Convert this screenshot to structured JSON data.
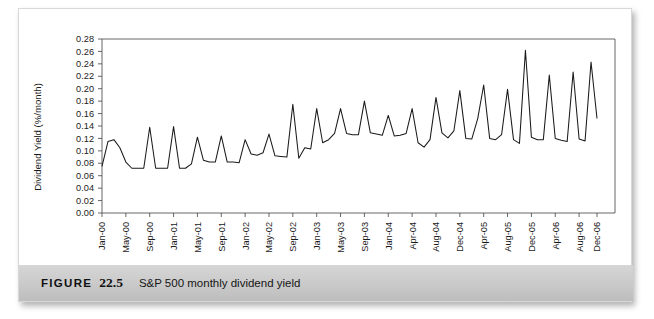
{
  "figure": {
    "label": "FIGURE",
    "number": "22.5",
    "caption": "S&P 500 monthly dividend yield"
  },
  "chart_data": {
    "type": "line",
    "title": "",
    "xlabel": "",
    "ylabel": "Dividend Yield (%/month)",
    "ylim": [
      0.0,
      0.28
    ],
    "ytick_step": 0.02,
    "ytick_labels": [
      "0.00",
      "0.02",
      "0.04",
      "0.06",
      "0.08",
      "0.10",
      "0.12",
      "0.14",
      "0.16",
      "0.18",
      "0.20",
      "0.22",
      "0.24",
      "0.26",
      "0.28"
    ],
    "grid": false,
    "legend": "none",
    "line_color": "#1a1a1a",
    "axis_color": "#555555",
    "xtick_labels": [
      "Jan-00",
      "May-00",
      "Sep-00",
      "Jan-01",
      "May-01",
      "Sep-01",
      "Jan-02",
      "May-02",
      "Sep-02",
      "Jan-03",
      "May-03",
      "Sep-03",
      "Jan-04",
      "Apr-04",
      "Aug-04",
      "Dec-04",
      "Apr-05",
      "Aug-05",
      "Dec-05",
      "Apr-06",
      "Aug-06",
      "Dec-06"
    ],
    "x_start": "Jan-00",
    "x_end": "Dec-06",
    "x_labels_every_n_points": 4,
    "x": [
      "Jan-00",
      "Feb-00",
      "Mar-00",
      "Apr-00",
      "May-00",
      "Jun-00",
      "Jul-00",
      "Aug-00",
      "Sep-00",
      "Oct-00",
      "Nov-00",
      "Dec-00",
      "Jan-01",
      "Feb-01",
      "Mar-01",
      "Apr-01",
      "May-01",
      "Jun-01",
      "Jul-01",
      "Aug-01",
      "Sep-01",
      "Oct-01",
      "Nov-01",
      "Dec-01",
      "Jan-02",
      "Feb-02",
      "Mar-02",
      "Apr-02",
      "May-02",
      "Jun-02",
      "Jul-02",
      "Aug-02",
      "Sep-02",
      "Oct-02",
      "Nov-02",
      "Dec-02",
      "Jan-03",
      "Feb-03",
      "Mar-03",
      "Apr-03",
      "May-03",
      "Jun-03",
      "Jul-03",
      "Aug-03",
      "Sep-03",
      "Oct-03",
      "Nov-03",
      "Dec-03",
      "Jan-04",
      "Feb-04",
      "Mar-04",
      "Apr-04",
      "May-04",
      "Jun-04",
      "Jul-04",
      "Aug-04",
      "Sep-04",
      "Oct-04",
      "Nov-04",
      "Dec-04",
      "Jan-05",
      "Feb-05",
      "Mar-05",
      "Apr-05",
      "May-05",
      "Jun-05",
      "Jul-05",
      "Aug-05",
      "Sep-05",
      "Oct-05",
      "Nov-05",
      "Dec-05",
      "Jan-06",
      "Feb-06",
      "Mar-06",
      "Apr-06",
      "May-06",
      "Jun-06",
      "Jul-06",
      "Aug-06",
      "Sep-06",
      "Oct-06",
      "Nov-06",
      "Dec-06"
    ],
    "values": [
      0.075,
      0.115,
      0.118,
      0.105,
      0.082,
      0.072,
      0.072,
      0.072,
      0.138,
      0.072,
      0.072,
      0.072,
      0.139,
      0.072,
      0.072,
      0.079,
      0.122,
      0.085,
      0.082,
      0.082,
      0.124,
      0.082,
      0.082,
      0.081,
      0.118,
      0.095,
      0.093,
      0.097,
      0.127,
      0.092,
      0.091,
      0.09,
      0.175,
      0.088,
      0.105,
      0.103,
      0.168,
      0.113,
      0.118,
      0.128,
      0.168,
      0.128,
      0.126,
      0.126,
      0.18,
      0.129,
      0.127,
      0.125,
      0.157,
      0.124,
      0.125,
      0.128,
      0.168,
      0.113,
      0.106,
      0.118,
      0.186,
      0.129,
      0.121,
      0.132,
      0.197,
      0.12,
      0.119,
      0.152,
      0.206,
      0.12,
      0.118,
      0.126,
      0.199,
      0.118,
      0.112,
      0.262,
      0.122,
      0.118,
      0.118,
      0.222,
      0.12,
      0.117,
      0.115,
      0.227,
      0.119,
      0.116,
      0.243,
      0.152
    ]
  }
}
